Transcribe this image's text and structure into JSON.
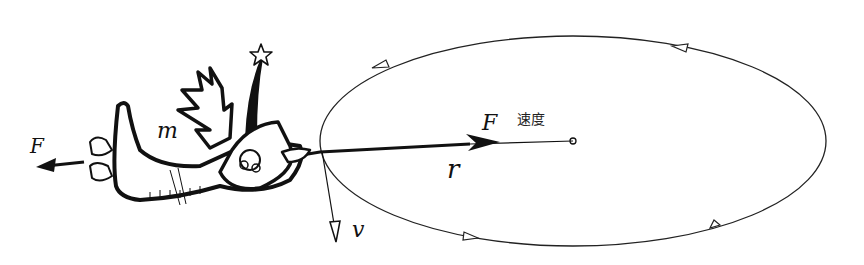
{
  "diagram": {
    "title": "",
    "labels": {
      "force_left": "F",
      "force_center": "F",
      "mass": "m",
      "radius": "r",
      "velocity": "v",
      "center_caption": "速度"
    },
    "elements": {
      "orbit": {
        "shape": "ellipse",
        "cx": 573,
        "cy": 141,
        "rx": 253,
        "ry": 105,
        "direction": "counter-clockwise"
      },
      "center_point": {
        "x": 573,
        "y": 141
      },
      "radius_vector": {
        "from": [
          312,
          152
        ],
        "to": [
          573,
          141
        ],
        "arrowhead_at": [
          498,
          143
        ]
      },
      "velocity_vector": {
        "from": [
          322,
          152
        ],
        "to": [
          336,
          242
        ]
      },
      "left_force_arrow": {
        "from": [
          84,
          162
        ],
        "to": [
          36,
          168
        ]
      },
      "creature": {
        "description": "cartoon creature with mass m, holding string, star-tipped antenna"
      }
    },
    "colors": {
      "ink": "#111111",
      "background": "#ffffff"
    }
  }
}
